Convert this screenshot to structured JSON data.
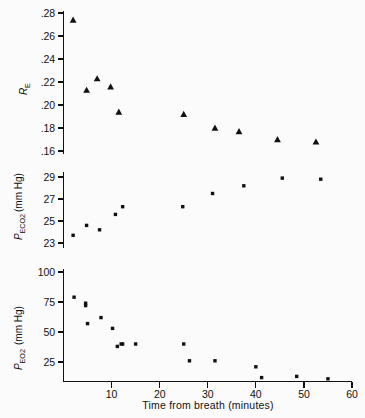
{
  "figure": {
    "background": "#fbfbfb",
    "ink_color": "#111111",
    "xlabel": "Time from breath (minutes)",
    "x_ticks": [
      10,
      20,
      30,
      40,
      50,
      60
    ],
    "x_tick_labels": [
      "10",
      "20",
      "30",
      "40",
      "50",
      "60"
    ],
    "xlim": [
      0,
      60
    ]
  },
  "chart_data": [
    {
      "type": "scatter",
      "panel": "top",
      "title": "",
      "ylabel": "R_E",
      "ylabel_main": "R",
      "ylabel_sub": "E",
      "xlabel": "",
      "xlim": [
        0,
        60
      ],
      "ylim": [
        0.15,
        0.29
      ],
      "y_ticks": [
        0.28,
        0.26,
        0.24,
        0.22,
        0.2,
        0.18,
        0.16
      ],
      "y_tick_labels": [
        ".28",
        ".26",
        ".24",
        ".22",
        ".20",
        ".18",
        ".16"
      ],
      "grid": false,
      "legend": "none",
      "marker": "triangle",
      "x": [
        2.0,
        4.8,
        7.0,
        9.8,
        11.5,
        25.0,
        31.5,
        36.5,
        44.5,
        52.5
      ],
      "values": [
        0.274,
        0.213,
        0.223,
        0.216,
        0.194,
        0.192,
        0.18,
        0.177,
        0.17,
        0.168
      ]
    },
    {
      "type": "scatter",
      "panel": "middle",
      "title": "",
      "ylabel": "P_ECO2 (mm Hg)",
      "ylabel_main": "P",
      "ylabel_sub": "ECO2",
      "ylabel_unit": "(mm Hg)",
      "xlabel": "",
      "xlim": [
        0,
        60
      ],
      "ylim": [
        22.2,
        29.8
      ],
      "y_ticks": [
        29,
        27,
        25,
        23
      ],
      "y_tick_labels": [
        "29",
        "27",
        "25",
        "23"
      ],
      "grid": false,
      "legend": "none",
      "marker": "square",
      "x": [
        2.0,
        4.8,
        7.5,
        10.8,
        12.3,
        24.8,
        31.0,
        37.5,
        45.5,
        53.5
      ],
      "values": [
        23.7,
        24.6,
        24.2,
        25.6,
        26.3,
        26.3,
        27.5,
        28.2,
        28.9,
        28.8
      ]
    },
    {
      "type": "scatter",
      "panel": "bottom",
      "title": "",
      "ylabel": "P_EO2 (mm Hg)",
      "ylabel_main": "P",
      "ylabel_sub": "EO2",
      "ylabel_unit": "(mm Hg)",
      "xlabel": "Time from breath (minutes)",
      "xlim": [
        0,
        60
      ],
      "ylim": [
        0,
        105
      ],
      "y_ticks": [
        100,
        75,
        50,
        25
      ],
      "y_tick_labels": [
        "100",
        "75",
        "50",
        "25"
      ],
      "grid": false,
      "legend": "none",
      "marker": "square",
      "x": [
        2.2,
        4.6,
        4.6,
        5.0,
        7.8,
        10.2,
        11.2,
        12.0,
        12.3,
        15.0,
        25.0,
        26.2,
        31.5,
        40.0,
        41.2,
        48.5,
        55.0
      ],
      "values": [
        79,
        74,
        72,
        57,
        62,
        53,
        38,
        40,
        40,
        40,
        40,
        26,
        26,
        21,
        12,
        13,
        11
      ]
    }
  ]
}
